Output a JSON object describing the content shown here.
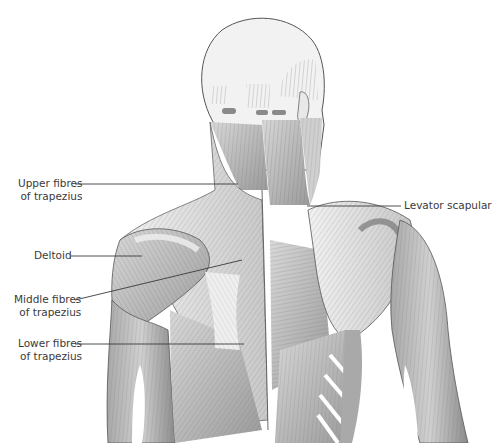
{
  "diagram": {
    "labels": [
      {
        "id": "upper-trapezius",
        "line1": "Upper fibres",
        "line2": "of trapezius"
      },
      {
        "id": "deltoid",
        "line1": "Deltoid",
        "line2": ""
      },
      {
        "id": "middle-trapezius",
        "line1": "Middle fibres",
        "line2": "of trapezius"
      },
      {
        "id": "lower-trapezius",
        "line1": "Lower fibres",
        "line2": "of trapezius"
      },
      {
        "id": "levator-scapulae",
        "line1": "Levator scapular",
        "line2": ""
      }
    ],
    "colors": {
      "background": "#ffffff",
      "muscle_light": "#e4e4e4",
      "muscle_mid": "#b8b8b8",
      "muscle_dark": "#8a8a8a",
      "outline": "#555555",
      "leader_line": "#3a3a3a",
      "label_text": "#3a3a3a"
    }
  }
}
